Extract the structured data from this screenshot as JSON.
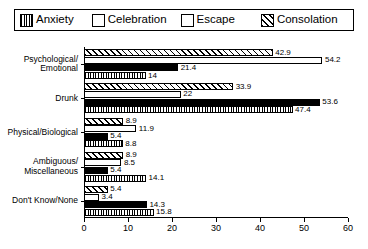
{
  "legend": {
    "items": [
      {
        "label": "Anxiety",
        "key": "anxiety",
        "swatch": "vertical-stripe-swatch"
      },
      {
        "label": "Celebration",
        "key": "celebration",
        "swatch": "solid-black-swatch"
      },
      {
        "label": "Escape",
        "key": "escape",
        "swatch": "white-swatch"
      },
      {
        "label": "Consolation",
        "key": "consolation",
        "swatch": "diagonal-hatch-swatch"
      }
    ]
  },
  "chart_data": {
    "type": "bar",
    "orientation": "horizontal",
    "title": "",
    "xlabel": "",
    "ylabel": "",
    "xlim": [
      0,
      60
    ],
    "xticks": [
      0,
      10,
      20,
      30,
      40,
      50,
      60
    ],
    "grid": false,
    "legend_position": "top",
    "categories": [
      "Psychological/\nEmotional",
      "Drunk",
      "Physical/Biological",
      "Ambiguous/\nMiscellaneous",
      "Don't Know/None"
    ],
    "series": [
      {
        "name": "Anxiety",
        "values": [
          14,
          47.4,
          8.8,
          14.1,
          15.8
        ]
      },
      {
        "name": "Celebration",
        "values": [
          21.4,
          53.6,
          5.4,
          5.4,
          14.3
        ]
      },
      {
        "name": "Escape",
        "values": [
          54.2,
          22,
          11.9,
          8.5,
          3.4
        ]
      },
      {
        "name": "Consolation",
        "values": [
          42.9,
          33.9,
          8.9,
          8.9,
          5.4
        ]
      }
    ],
    "bar_order_top_to_bottom": [
      "Consolation",
      "Escape",
      "Celebration",
      "Anxiety"
    ],
    "value_labels": {
      "Psychological/Emotional": [
        "42.9",
        "54.2",
        "21.4",
        "14"
      ],
      "Drunk": [
        "33.9",
        "22",
        "53.6",
        "47.4"
      ],
      "Physical/Biological": [
        "8.9",
        "11.9",
        "5.4",
        "8.8"
      ],
      "Ambiguous/Miscellaneous": [
        "8.9",
        "8.5",
        "5.4",
        "14.1"
      ],
      "Don't Know/None": [
        "5.4",
        "3.4",
        "14.3",
        "15.8"
      ]
    }
  },
  "colors": {
    "ink": "#000000",
    "background": "#ffffff"
  }
}
